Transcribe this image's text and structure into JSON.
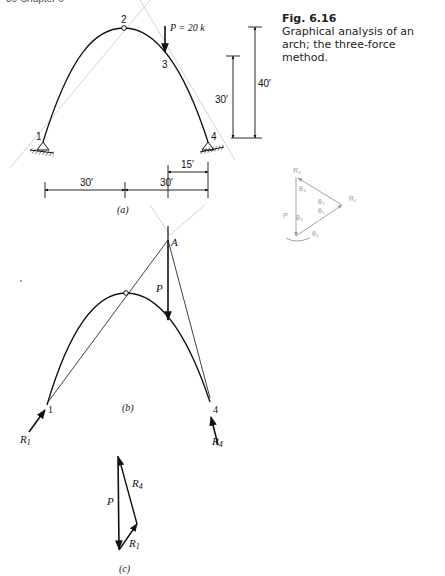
{
  "page_header": "36   Chapter 6",
  "figure": {
    "number": "Fig. 6.16",
    "caption": "Graphical analysis of an arch; the three-force method."
  },
  "part_a": {
    "label": "(a)",
    "nodes": [
      "1",
      "2",
      "3",
      "4"
    ],
    "load_label": "P = 20 k",
    "dims": {
      "vertical_inner": "30′",
      "vertical_outer": "40′",
      "horizontal_left": "30′",
      "horizontal_right": "30′",
      "horizontal_partial": "15′"
    }
  },
  "part_b": {
    "label": "(b)",
    "point_A": "A",
    "load_label": "P",
    "node_left": "1",
    "node_right": "4",
    "reaction_left": "R1",
    "reaction_right": "R4"
  },
  "part_c": {
    "label": "(c)",
    "force_P": "P",
    "force_R4": "R4",
    "force_R1": "R1"
  },
  "pencil_sketch": {
    "labels": [
      "R4",
      "θ4",
      "θ2",
      "θ1",
      "R1",
      "P",
      "θ3",
      "θ1"
    ]
  },
  "colors": {
    "ink": "#111111",
    "pencil": "#9a9a9a",
    "background": "#ffffff"
  }
}
